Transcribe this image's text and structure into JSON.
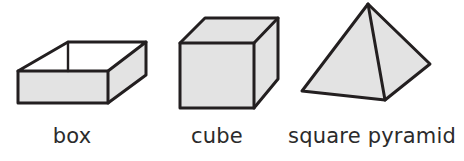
{
  "figure": {
    "background_color": "#ffffff",
    "stroke_color": "#231f20",
    "fill_color": "#e3e3e3",
    "open_face_color": "#ffffff",
    "label_color": "#2b2b2b"
  },
  "shapes": [
    {
      "name": "box",
      "label": "box",
      "kind": "open rectangular box",
      "stroke_width": 3,
      "faces": {
        "front": "18,71 108,71 108,103 18,103",
        "right": "108,71 146,42 146,75 108,103",
        "inner_back": "68,42 146,42 108,71 18,71",
        "rim_left": "18,71 68,42"
      }
    },
    {
      "name": "cube",
      "label": "cube",
      "kind": "cube",
      "stroke_width": 3,
      "faces": {
        "front": "180,43 254,43 254,108 180,108",
        "top": "180,43 205,18 278,18 254,43",
        "right": "254,43 278,18 278,79 254,108"
      }
    },
    {
      "name": "square-pyramid",
      "label": "square pyramid",
      "kind": "square pyramid",
      "stroke_width": 3,
      "faces": {
        "left": "368,4 302,91 385,100",
        "right": "368,4 385,100 430,64"
      },
      "apex": "368,4",
      "base_corners": [
        "302,91",
        "385,100",
        "430,64"
      ]
    }
  ],
  "labels": {
    "box": "box",
    "cube": "cube",
    "pyramid": "square pyramid"
  }
}
